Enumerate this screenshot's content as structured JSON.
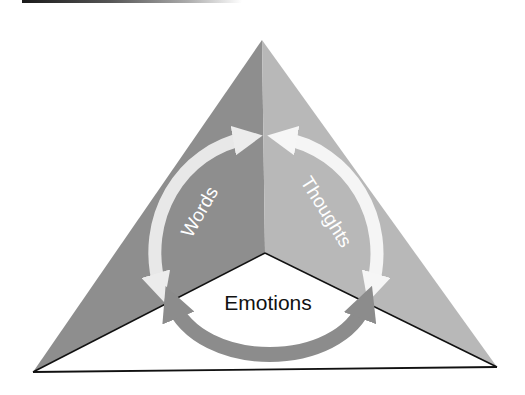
{
  "diagram": {
    "type": "triangle-cycle",
    "faces": {
      "left": {
        "color": "#8e8e8e"
      },
      "right": {
        "color": "#b8b8b8"
      },
      "bottom": {
        "color": "#ffffff"
      }
    },
    "labels": {
      "left": "Words",
      "right": "Thoughts",
      "bottom": "Emotions"
    },
    "arrows": [
      {
        "name": "words-arrow",
        "color": "#e6e6e6",
        "style": "double-headed arc"
      },
      {
        "name": "thoughts-arrow",
        "color": "#f2f2f2",
        "style": "double-headed arc"
      },
      {
        "name": "emotions-arrow",
        "color": "#8c8c8c",
        "style": "double-headed arc"
      }
    ]
  }
}
